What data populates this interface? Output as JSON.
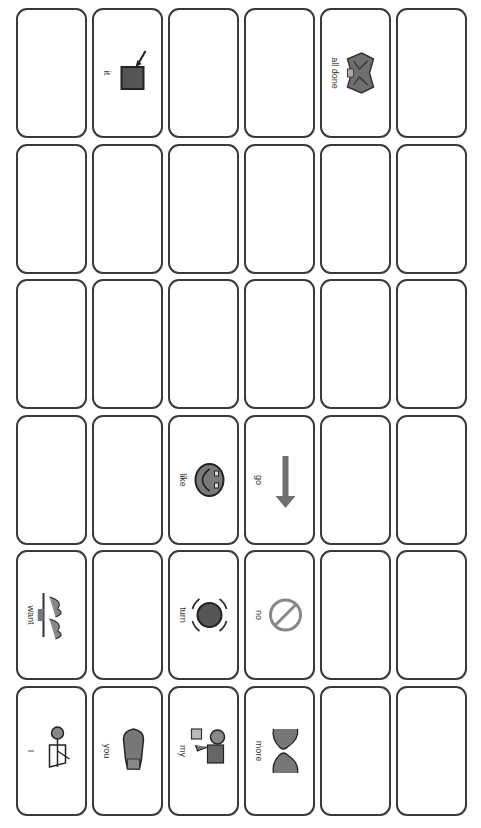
{
  "board": {
    "rows": 6,
    "cols": 6,
    "colors": {
      "border": "#3a3a3a",
      "symbol_fill": "#7a7a7a",
      "symbol_dark": "#555555",
      "background": "#ffffff"
    },
    "cells": [
      {
        "row": 0,
        "col": 0,
        "label": "",
        "icon": ""
      },
      {
        "row": 0,
        "col": 1,
        "label": "it",
        "icon": "arrow-pointing-square-icon"
      },
      {
        "row": 0,
        "col": 2,
        "label": "",
        "icon": ""
      },
      {
        "row": 0,
        "col": 3,
        "label": "",
        "icon": ""
      },
      {
        "row": 0,
        "col": 4,
        "label": "all done",
        "icon": "all-done-hands-icon"
      },
      {
        "row": 0,
        "col": 5,
        "label": "",
        "icon": ""
      },
      {
        "row": 1,
        "col": 0,
        "label": "",
        "icon": ""
      },
      {
        "row": 1,
        "col": 1,
        "label": "",
        "icon": ""
      },
      {
        "row": 1,
        "col": 2,
        "label": "",
        "icon": ""
      },
      {
        "row": 1,
        "col": 3,
        "label": "",
        "icon": ""
      },
      {
        "row": 1,
        "col": 4,
        "label": "",
        "icon": ""
      },
      {
        "row": 1,
        "col": 5,
        "label": "",
        "icon": ""
      },
      {
        "row": 2,
        "col": 0,
        "label": "",
        "icon": ""
      },
      {
        "row": 2,
        "col": 1,
        "label": "",
        "icon": ""
      },
      {
        "row": 2,
        "col": 2,
        "label": "",
        "icon": ""
      },
      {
        "row": 2,
        "col": 3,
        "label": "",
        "icon": ""
      },
      {
        "row": 2,
        "col": 4,
        "label": "",
        "icon": ""
      },
      {
        "row": 2,
        "col": 5,
        "label": "",
        "icon": ""
      },
      {
        "row": 3,
        "col": 0,
        "label": "",
        "icon": ""
      },
      {
        "row": 3,
        "col": 1,
        "label": "",
        "icon": ""
      },
      {
        "row": 3,
        "col": 2,
        "label": "like",
        "icon": "smiling-face-icon"
      },
      {
        "row": 3,
        "col": 3,
        "label": "go",
        "icon": "arrow-up-icon"
      },
      {
        "row": 3,
        "col": 4,
        "label": "",
        "icon": ""
      },
      {
        "row": 3,
        "col": 5,
        "label": "",
        "icon": ""
      },
      {
        "row": 4,
        "col": 0,
        "label": "want",
        "icon": "want-hands-icon"
      },
      {
        "row": 4,
        "col": 1,
        "label": "",
        "icon": ""
      },
      {
        "row": 4,
        "col": 2,
        "label": "turn",
        "icon": "turn-circle-icon"
      },
      {
        "row": 4,
        "col": 3,
        "label": "no",
        "icon": "prohibited-icon"
      },
      {
        "row": 4,
        "col": 4,
        "label": "",
        "icon": ""
      },
      {
        "row": 4,
        "col": 5,
        "label": "",
        "icon": ""
      },
      {
        "row": 5,
        "col": 0,
        "label": "I",
        "icon": "person-self-icon"
      },
      {
        "row": 5,
        "col": 1,
        "label": "you",
        "icon": "pointing-hand-icon"
      },
      {
        "row": 5,
        "col": 2,
        "label": "my",
        "icon": "person-holding-box-icon"
      },
      {
        "row": 5,
        "col": 3,
        "label": "more",
        "icon": "more-hands-icon"
      },
      {
        "row": 5,
        "col": 4,
        "label": "",
        "icon": ""
      },
      {
        "row": 5,
        "col": 5,
        "label": "",
        "icon": ""
      }
    ]
  }
}
